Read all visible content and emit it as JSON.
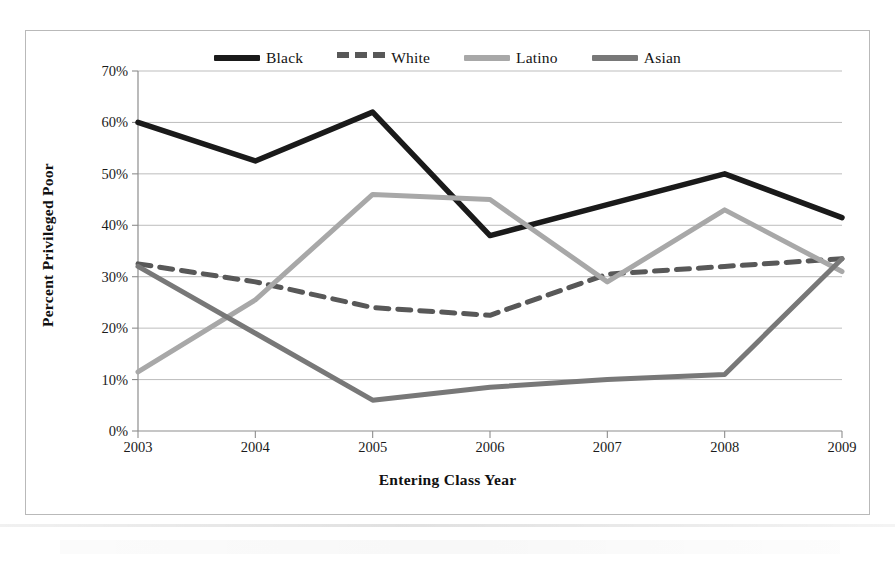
{
  "figure": {
    "border_color": "#b9b9b9",
    "background": "#ffffff"
  },
  "legend": {
    "position": "top-center",
    "entries": [
      {
        "label": "Black",
        "color": "#1a1a1a",
        "style": "solid"
      },
      {
        "label": "White",
        "color": "#585858",
        "style": "dashed"
      },
      {
        "label": "Latino",
        "color": "#a8a8a8",
        "style": "solid"
      },
      {
        "label": "Asian",
        "color": "#787878",
        "style": "solid"
      }
    ]
  },
  "axes": {
    "ylabel": "Percent Privileged Poor",
    "xlabel": "Entering Class Year",
    "yticks": [
      "0%",
      "10%",
      "20%",
      "30%",
      "40%",
      "50%",
      "60%",
      "70%"
    ],
    "xticks": [
      "2003",
      "2004",
      "2005",
      "2006",
      "2007",
      "2008",
      "2009"
    ]
  },
  "chart_data": {
    "type": "line",
    "title": "",
    "xlabel": "Entering Class Year",
    "ylabel": "Percent Privileged Poor",
    "x": [
      2003,
      2004,
      2005,
      2006,
      2007,
      2008,
      2009
    ],
    "xlim": [
      2003,
      2009
    ],
    "ylim": [
      0,
      70
    ],
    "ytick_step": 10,
    "y_unit": "percent",
    "grid": "horizontal",
    "legend_position": "top-center",
    "series": [
      {
        "name": "Black",
        "color": "#1a1a1a",
        "style": "solid",
        "values": [
          60.0,
          52.5,
          62.0,
          38.0,
          44.0,
          50.0,
          41.5
        ]
      },
      {
        "name": "White",
        "color": "#585858",
        "style": "dashed",
        "values": [
          32.5,
          29.0,
          24.0,
          22.5,
          30.5,
          32.0,
          33.5
        ]
      },
      {
        "name": "Latino",
        "color": "#a8a8a8",
        "style": "solid",
        "values": [
          11.5,
          25.5,
          46.0,
          45.0,
          29.0,
          43.0,
          31.0
        ]
      },
      {
        "name": "Asian",
        "color": "#787878",
        "style": "solid",
        "values": [
          32.0,
          19.0,
          6.0,
          8.5,
          10.0,
          11.0,
          33.5
        ]
      }
    ]
  }
}
